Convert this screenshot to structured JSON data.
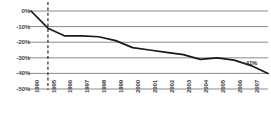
{
  "chart_data": {
    "type": "line",
    "title": "",
    "subtitle": "",
    "xlabel": "",
    "ylabel": "",
    "categories": [
      "1990",
      "1995",
      "1996",
      "1997",
      "1998",
      "1999",
      "2000",
      "2001",
      "2002",
      "2003",
      "2004",
      "2005",
      "2006",
      "2007",
      "2008"
    ],
    "values": [
      0,
      -11,
      -16,
      -16,
      -16.5,
      -19,
      -23.5,
      -25,
      -26.5,
      -28,
      -31,
      -30,
      -31.5,
      -35,
      -40
    ],
    "series": [
      {
        "name": "Change",
        "values": [
          0,
          -11,
          -16,
          -16,
          -16.5,
          -19,
          -23.5,
          -25,
          -26.5,
          -28,
          -31,
          -30,
          -31.5,
          -35,
          -40
        ]
      }
    ],
    "ylim": [
      -50,
      0
    ],
    "yticks": [
      0,
      -10,
      -20,
      -30,
      -40,
      -50
    ],
    "ytick_labels": [
      "0%",
      "-10%",
      "-20%",
      "-30%",
      "-40%",
      "-50%"
    ],
    "xtick_labels": [
      "1990",
      "1995",
      "1996",
      "1997",
      "1998",
      "1999",
      "2000",
      "2001",
      "2002",
      "2003",
      "2004",
      "2005",
      "2006",
      "2007",
      "2008"
    ],
    "grid": true,
    "legend": false,
    "legend_position": "none",
    "annotations": [
      {
        "text": "-41%",
        "x": "2008",
        "y": -40
      }
    ],
    "reference_lines": [
      {
        "type": "vertical",
        "x": "1995",
        "style": "dashed"
      }
    ],
    "colors": {
      "line": "#1a1a1a",
      "grid": "#8a8a8a",
      "reference_line": "#3a3a3a",
      "axis_text": "#3d3d3d",
      "background": "#ffffff"
    }
  }
}
